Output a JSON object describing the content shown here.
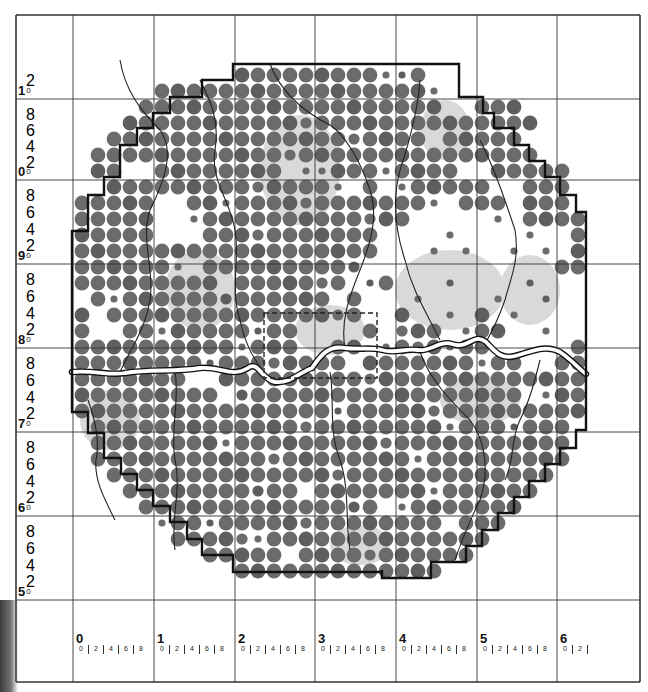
{
  "map": {
    "title": "",
    "colors": {
      "dot": "#6b6b6b",
      "dot_dark": "#5e5e5e",
      "boundary": "#111111",
      "grid": "#333333",
      "river_fill": "#ffffff",
      "river_stroke": "#111111",
      "tributary": "#222222",
      "shading": "#d9d9d9",
      "dashed_box": "#222222"
    },
    "grid": {
      "x_lines": [
        16,
        73,
        154,
        235,
        315,
        396,
        477,
        557,
        640
      ],
      "y_lines": [
        15,
        99,
        180,
        264,
        348,
        432,
        516,
        600,
        682
      ]
    },
    "x_axis": {
      "major_labels": [
        "0",
        "1",
        "2",
        "3",
        "4",
        "5",
        "6"
      ],
      "minor_labels": [
        "0",
        "2",
        "4",
        "6",
        "8"
      ],
      "last_minor_labels": [
        "0",
        "2"
      ]
    },
    "y_axis": {
      "major_labels": [
        "1",
        "0",
        "9",
        "8",
        "7",
        "6",
        "5"
      ],
      "major_suffix": "0",
      "minor_labels": [
        "8",
        "6",
        "4",
        "2"
      ],
      "top_partial_minor": [
        "2"
      ]
    },
    "dot_lattice": {
      "origin_x": 82,
      "origin_y": 75,
      "step": 16,
      "big_radius": 7.4,
      "rows": [
        {
          "row": 0,
          "from": 10,
          "to": 23
        },
        {
          "row": 1,
          "from": 5,
          "to": 25
        },
        {
          "row": 2,
          "from": 4,
          "to": 27
        },
        {
          "row": 3,
          "from": 3,
          "to": 28
        },
        {
          "row": 4,
          "from": 2,
          "to": 29
        },
        {
          "row": 5,
          "from": 1,
          "to": 29
        },
        {
          "row": 6,
          "from": 1,
          "to": 30
        },
        {
          "row": 7,
          "from": 1,
          "to": 30
        },
        {
          "row": 8,
          "from": 0,
          "to": 30
        },
        {
          "row": 9,
          "from": 0,
          "to": 31
        },
        {
          "row": 10,
          "from": 0,
          "to": 31
        },
        {
          "row": 11,
          "from": 0,
          "to": 31
        },
        {
          "row": 12,
          "from": 0,
          "to": 31
        },
        {
          "row": 13,
          "from": 0,
          "to": 31
        },
        {
          "row": 14,
          "from": 0,
          "to": 31
        },
        {
          "row": 15,
          "from": 0,
          "to": 31
        },
        {
          "row": 16,
          "from": 0,
          "to": 31
        },
        {
          "row": 17,
          "from": 0,
          "to": 31
        },
        {
          "row": 18,
          "from": 0,
          "to": 31
        },
        {
          "row": 19,
          "from": 0,
          "to": 31
        },
        {
          "row": 20,
          "from": 0,
          "to": 31
        },
        {
          "row": 21,
          "from": 0,
          "to": 31
        },
        {
          "row": 22,
          "from": 1,
          "to": 30
        },
        {
          "row": 23,
          "from": 1,
          "to": 30
        },
        {
          "row": 24,
          "from": 1,
          "to": 30
        },
        {
          "row": 25,
          "from": 2,
          "to": 29
        },
        {
          "row": 26,
          "from": 3,
          "to": 28
        },
        {
          "row": 27,
          "from": 4,
          "to": 27
        },
        {
          "row": 28,
          "from": 5,
          "to": 26
        },
        {
          "row": 29,
          "from": 6,
          "to": 25
        },
        {
          "row": 30,
          "from": 8,
          "to": 24
        },
        {
          "row": 31,
          "from": 10,
          "to": 22
        }
      ],
      "empty_cells": [
        [
          0,
          22
        ],
        [
          0,
          23
        ],
        [
          1,
          22
        ],
        [
          1,
          23
        ],
        [
          1,
          24
        ],
        [
          1,
          25
        ],
        [
          2,
          23
        ],
        [
          2,
          24
        ],
        [
          4,
          22
        ],
        [
          4,
          28
        ],
        [
          4,
          29
        ],
        [
          5,
          29
        ],
        [
          6,
          3
        ],
        [
          6,
          4
        ],
        [
          6,
          13
        ],
        [
          6,
          19
        ],
        [
          6,
          24
        ],
        [
          6,
          25
        ],
        [
          7,
          0
        ],
        [
          7,
          1
        ],
        [
          7,
          16
        ],
        [
          7,
          17
        ],
        [
          7,
          19
        ],
        [
          7,
          26
        ],
        [
          7,
          27
        ],
        [
          8,
          5
        ],
        [
          8,
          6
        ],
        [
          8,
          22
        ],
        [
          8,
          23
        ],
        [
          8,
          27
        ],
        [
          9,
          5
        ],
        [
          9,
          6
        ],
        [
          9,
          21
        ],
        [
          9,
          22
        ],
        [
          9,
          23
        ],
        [
          9,
          24
        ],
        [
          9,
          25
        ],
        [
          9,
          27
        ],
        [
          10,
          5
        ],
        [
          10,
          6
        ],
        [
          10,
          7
        ],
        [
          10,
          19
        ],
        [
          10,
          20
        ],
        [
          10,
          21
        ],
        [
          10,
          22
        ],
        [
          10,
          24
        ],
        [
          10,
          25
        ],
        [
          10,
          26
        ],
        [
          10,
          27
        ],
        [
          10,
          29
        ],
        [
          10,
          30
        ],
        [
          11,
          19
        ],
        [
          11,
          20
        ],
        [
          11,
          21
        ],
        [
          11,
          23
        ],
        [
          11,
          25
        ],
        [
          11,
          26
        ],
        [
          11,
          28
        ],
        [
          11,
          30
        ],
        [
          12,
          6
        ],
        [
          12,
          7
        ],
        [
          12,
          18
        ],
        [
          12,
          19
        ],
        [
          12,
          20
        ],
        [
          12,
          21
        ],
        [
          12,
          22
        ],
        [
          12,
          23
        ],
        [
          12,
          24
        ],
        [
          12,
          25
        ],
        [
          12,
          26
        ],
        [
          12,
          27
        ],
        [
          12,
          28
        ],
        [
          12,
          29
        ],
        [
          13,
          9
        ],
        [
          13,
          17
        ],
        [
          13,
          18
        ],
        [
          13,
          20
        ],
        [
          13,
          21
        ],
        [
          13,
          22
        ],
        [
          13,
          24
        ],
        [
          13,
          25
        ],
        [
          13,
          26
        ],
        [
          13,
          27
        ],
        [
          13,
          29
        ],
        [
          13,
          30
        ],
        [
          13,
          31
        ],
        [
          14,
          0
        ],
        [
          14,
          16
        ],
        [
          14,
          18
        ],
        [
          14,
          19
        ],
        [
          14,
          20
        ],
        [
          14,
          22
        ],
        [
          14,
          23
        ],
        [
          14,
          24
        ],
        [
          14,
          25
        ],
        [
          14,
          27
        ],
        [
          14,
          28
        ],
        [
          14,
          30
        ],
        [
          14,
          31
        ],
        [
          15,
          1
        ],
        [
          15,
          18
        ],
        [
          15,
          19
        ],
        [
          15,
          21
        ],
        [
          15,
          22
        ],
        [
          15,
          24
        ],
        [
          15,
          26
        ],
        [
          15,
          28
        ],
        [
          15,
          29
        ],
        [
          15,
          30
        ],
        [
          15,
          31
        ],
        [
          16,
          1
        ],
        [
          16,
          2
        ],
        [
          16,
          14
        ],
        [
          16,
          15
        ],
        [
          16,
          16
        ],
        [
          16,
          17
        ],
        [
          16,
          19
        ],
        [
          16,
          23
        ],
        [
          16,
          27
        ],
        [
          16,
          28
        ],
        [
          16,
          30
        ],
        [
          16,
          31
        ],
        [
          17,
          14
        ],
        [
          17,
          15
        ],
        [
          17,
          18
        ],
        [
          17,
          26
        ],
        [
          17,
          27
        ],
        [
          17,
          28
        ],
        [
          17,
          29
        ],
        [
          17,
          30
        ],
        [
          18,
          17
        ],
        [
          18,
          28
        ],
        [
          18,
          29
        ],
        [
          19,
          7
        ],
        [
          19,
          8
        ],
        [
          20,
          9
        ],
        [
          20,
          28
        ],
        [
          26,
          14
        ],
        [
          27,
          19
        ],
        [
          28,
          23
        ],
        [
          29,
          11
        ],
        [
          30,
          13
        ]
      ],
      "small_dots": [
        [
          0,
          19
        ],
        [
          0,
          20
        ],
        [
          1,
          22
        ],
        [
          2,
          3
        ],
        [
          5,
          0
        ],
        [
          6,
          14
        ],
        [
          6,
          15
        ],
        [
          6,
          19
        ],
        [
          7,
          16
        ],
        [
          7,
          20
        ],
        [
          8,
          9
        ],
        [
          8,
          22
        ],
        [
          9,
          7
        ],
        [
          9,
          26
        ],
        [
          10,
          23
        ],
        [
          10,
          28
        ],
        [
          11,
          22
        ],
        [
          11,
          24
        ],
        [
          11,
          27
        ],
        [
          11,
          29
        ],
        [
          12,
          6
        ],
        [
          13,
          18
        ],
        [
          13,
          23
        ],
        [
          13,
          28
        ],
        [
          14,
          2
        ],
        [
          14,
          21
        ],
        [
          14,
          26
        ],
        [
          14,
          29
        ],
        [
          15,
          23
        ],
        [
          15,
          27
        ],
        [
          16,
          5
        ],
        [
          16,
          11
        ],
        [
          16,
          24
        ],
        [
          16,
          29
        ],
        [
          17,
          10
        ],
        [
          17,
          19
        ],
        [
          17,
          23
        ],
        [
          18,
          8
        ],
        [
          18,
          25
        ],
        [
          20,
          29
        ],
        [
          21,
          16
        ],
        [
          22,
          23
        ],
        [
          22,
          27
        ],
        [
          23,
          9
        ],
        [
          24,
          21
        ],
        [
          26,
          22
        ],
        [
          27,
          20
        ],
        [
          28,
          5
        ],
        [
          28,
          8
        ],
        [
          29,
          11
        ]
      ],
      "medium_dots": [
        [
          3,
          14
        ],
        [
          4,
          17
        ],
        [
          5,
          13
        ],
        [
          7,
          11
        ],
        [
          8,
          14
        ],
        [
          9,
          18
        ],
        [
          10,
          11
        ],
        [
          12,
          17
        ],
        [
          13,
          15
        ],
        [
          14,
          9
        ],
        [
          15,
          16
        ],
        [
          16,
          20
        ],
        [
          17,
          21
        ],
        [
          18,
          12
        ],
        [
          19,
          18
        ],
        [
          20,
          10
        ],
        [
          21,
          22
        ],
        [
          22,
          14
        ],
        [
          23,
          19
        ],
        [
          24,
          12
        ],
        [
          25,
          16
        ],
        [
          26,
          11
        ],
        [
          27,
          17
        ],
        [
          28,
          14
        ],
        [
          29,
          10
        ],
        [
          30,
          18
        ]
      ]
    },
    "boundary_path": "M233,64 H459 V97 H483 V113 H494 V128 H514 V145 H529 V161 H545 V177 H560 V195 H576 V212 H586 V430 H576 V448 H560 V464 H545 V481 H529 V497 H514 V513 H498 V530 H482 V546 H466 V562 H431 V578 H382 V570 L382,572 H233 V555 H202 V539 H187 V522 H170 V506 H153 V490 H137 V474 H121 V458 H104 V433 H88 V412 H72 V231 H88 V195 H104 V177 H120 V145 H137 V128 H153 V113 H170 V97 H202 V80 H233 Z",
    "dashed_box": {
      "x": 264,
      "y": 313,
      "w": 113,
      "h": 65
    },
    "river_main": "M72,372 C95,370 110,376 125,373 C150,369 175,372 200,368 C220,366 232,378 248,368 C258,360 262,380 275,382 C290,384 300,372 312,368 C320,356 328,345 345,348 C360,350 372,347 382,350 C395,354 405,348 418,350 C430,352 440,340 452,344 C468,350 474,332 486,342 C494,350 500,360 515,356 C530,352 545,344 560,352 C572,360 578,368 586,374",
    "tributaries": [
      "M120,60 C125,90 140,110 160,130 C175,150 165,180 150,210 C140,240 155,270 150,300 C145,330 130,350 120,372",
      "M200,80 C210,100 220,120 215,150 C210,180 230,200 235,230 C240,260 230,290 240,320 C245,345 255,360 262,370",
      "M270,64 C280,90 300,110 330,125 C345,135 360,160 370,190 C378,215 372,240 360,270 C350,295 340,320 345,348",
      "M420,80 C418,110 410,140 400,170 C392,200 395,230 405,260 C412,290 425,310 440,340",
      "M480,140 C495,170 505,200 515,230 C520,260 510,280 505,300 C498,320 490,335 486,342",
      "M330,372 C335,400 328,430 340,460 C350,490 345,520 350,550",
      "M420,352 C430,380 450,400 470,420 C485,440 490,470 480,500 C470,520 460,545 455,560",
      "M175,372 C180,400 170,430 175,460 C182,490 170,520 175,550",
      "M88,400 C95,420 100,440 96,460 C94,480 105,500 115,520",
      "M540,360 C535,380 530,400 520,420 C510,440 515,460 505,480"
    ],
    "shaded_areas": [
      {
        "cx": 300,
        "cy": 170,
        "rx": 40,
        "ry": 55
      },
      {
        "cx": 450,
        "cy": 290,
        "rx": 55,
        "ry": 40
      },
      {
        "cx": 530,
        "cy": 290,
        "rx": 30,
        "ry": 35
      },
      {
        "cx": 200,
        "cy": 290,
        "rx": 35,
        "ry": 40
      },
      {
        "cx": 110,
        "cy": 420,
        "rx": 30,
        "ry": 30
      },
      {
        "cx": 330,
        "cy": 330,
        "rx": 35,
        "ry": 25
      },
      {
        "cx": 480,
        "cy": 400,
        "rx": 40,
        "ry": 25
      },
      {
        "cx": 360,
        "cy": 545,
        "rx": 30,
        "ry": 20
      },
      {
        "cx": 445,
        "cy": 130,
        "rx": 25,
        "ry": 30
      }
    ]
  }
}
